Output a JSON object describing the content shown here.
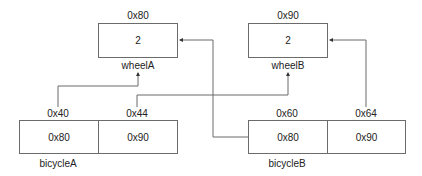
{
  "diagram": {
    "type": "memory-layout",
    "colors": {
      "stroke": "#6b6b6b",
      "text": "#222222",
      "background": "#ffffff"
    },
    "objects": [
      {
        "id": "wheelA",
        "name": "wheelA",
        "address": "0x80",
        "value": "2"
      },
      {
        "id": "wheelB",
        "name": "wheelB",
        "address": "0x90",
        "value": "2"
      },
      {
        "id": "bicycleA",
        "name": "bicycleA",
        "slots": [
          {
            "address": "0x40",
            "value": "0x80"
          },
          {
            "address": "0x44",
            "value": "0x90"
          }
        ]
      },
      {
        "id": "bicycleB",
        "name": "bicycleB",
        "slots": [
          {
            "address": "0x60",
            "value": "0x80"
          },
          {
            "address": "0x64",
            "value": "0x90"
          }
        ]
      }
    ],
    "edges": [
      {
        "from": "bicycleA.0x40",
        "to": "wheelA"
      },
      {
        "from": "bicycleA.0x44",
        "to": "wheelB"
      },
      {
        "from": "bicycleB.0x60",
        "to": "wheelA"
      },
      {
        "from": "bicycleB.0x64",
        "to": "wheelB"
      }
    ]
  }
}
